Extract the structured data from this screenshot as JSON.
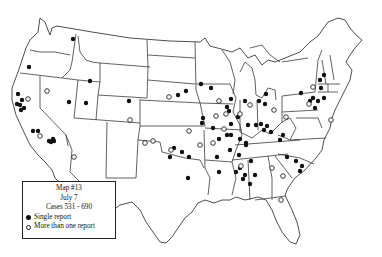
{
  "map": {
    "subject": "United States outline map with state boundaries",
    "top_caption_partial": "",
    "legend": {
      "title": "Map #13",
      "date": "July 7",
      "cases": "Cases 531 - 690",
      "items": [
        {
          "symbol": "filled-circle",
          "label": "Single report"
        },
        {
          "symbol": "open-circle",
          "label": "More than one report"
        }
      ]
    },
    "markers": {
      "single": [
        [
          73,
          39
        ],
        [
          29,
          67
        ],
        [
          90,
          81
        ],
        [
          86,
          103
        ],
        [
          69,
          102
        ],
        [
          18,
          94
        ],
        [
          22,
          100
        ],
        [
          17,
          104
        ],
        [
          21,
          110
        ],
        [
          24,
          108
        ],
        [
          20,
          105
        ],
        [
          33,
          131
        ],
        [
          38,
          131
        ],
        [
          49,
          141
        ],
        [
          53,
          139
        ],
        [
          51,
          142
        ],
        [
          54,
          141
        ],
        [
          129,
          101
        ],
        [
          178,
          95
        ],
        [
          201,
          84
        ],
        [
          186,
          91
        ],
        [
          203,
          118
        ],
        [
          211,
          88
        ],
        [
          231,
          99
        ],
        [
          227,
          107
        ],
        [
          229,
          111
        ],
        [
          238,
          117
        ],
        [
          248,
          125
        ],
        [
          256,
          125
        ],
        [
          246,
          143
        ],
        [
          231,
          135
        ],
        [
          230,
          150
        ],
        [
          239,
          155
        ],
        [
          251,
          161
        ],
        [
          236,
          172
        ],
        [
          202,
          123
        ],
        [
          213,
          128
        ],
        [
          219,
          139
        ],
        [
          217,
          157
        ],
        [
          227,
          135
        ],
        [
          240,
          139
        ],
        [
          246,
          145
        ],
        [
          266,
          94
        ],
        [
          245,
          101
        ],
        [
          259,
          101
        ],
        [
          265,
          104
        ],
        [
          231,
          124
        ],
        [
          261,
          124
        ],
        [
          267,
          126
        ],
        [
          271,
          132
        ],
        [
          280,
          140
        ],
        [
          283,
          135
        ],
        [
          264,
          130
        ],
        [
          174,
          148
        ],
        [
          182,
          152
        ],
        [
          170,
          157
        ],
        [
          189,
          157
        ],
        [
          188,
          178
        ],
        [
          219,
          172
        ],
        [
          240,
          168
        ],
        [
          245,
          175
        ],
        [
          243,
          179
        ],
        [
          255,
          175
        ],
        [
          250,
          184
        ],
        [
          301,
          93
        ],
        [
          310,
          101
        ],
        [
          313,
          98
        ],
        [
          318,
          101
        ],
        [
          324,
          98
        ],
        [
          315,
          108
        ],
        [
          320,
          80
        ],
        [
          324,
          75
        ],
        [
          321,
          88
        ],
        [
          287,
          157
        ],
        [
          296,
          161
        ],
        [
          302,
          166
        ],
        [
          300,
          171
        ]
      ],
      "multi": [
        [
          47,
          91
        ],
        [
          28,
          99
        ],
        [
          40,
          136
        ],
        [
          153,
          141
        ],
        [
          189,
          131
        ],
        [
          224,
          129
        ],
        [
          200,
          145
        ],
        [
          213,
          143
        ],
        [
          171,
          150
        ],
        [
          226,
          114
        ],
        [
          219,
          101
        ],
        [
          216,
          116
        ],
        [
          240,
          114
        ],
        [
          274,
          110
        ],
        [
          250,
          105
        ],
        [
          286,
          117
        ],
        [
          331,
          120
        ],
        [
          313,
          87
        ],
        [
          309,
          104
        ],
        [
          241,
          166
        ],
        [
          272,
          168
        ],
        [
          283,
          176
        ],
        [
          281,
          200
        ],
        [
          74,
          157
        ],
        [
          130,
          120
        ],
        [
          169,
          97
        ],
        [
          145,
          143
        ]
      ]
    }
  }
}
